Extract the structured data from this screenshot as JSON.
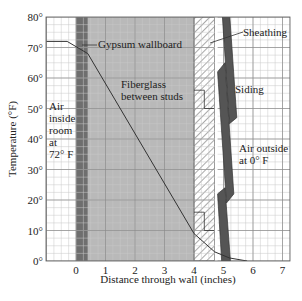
{
  "chart_data": {
    "type": "line",
    "title": "",
    "xlabel": "Distance through wall (inches)",
    "ylabel": "Temperature (°F)",
    "xlim": [
      -1,
      7.5
    ],
    "ylim": [
      0,
      80
    ],
    "x_ticks": [
      "0",
      "1",
      "2",
      "3",
      "4",
      "5",
      "6",
      "7"
    ],
    "y_ticks": [
      "0°",
      "10°",
      "20°",
      "30°",
      "40°",
      "50°",
      "60°",
      "70°",
      "80°"
    ],
    "grid": true,
    "series": [
      {
        "name": "Temperature profile",
        "x": [
          -1.0,
          -0.3,
          0.4,
          4.0,
          4.7,
          5.2,
          5.8
        ],
        "y": [
          72,
          72,
          68,
          9,
          3,
          1,
          0
        ]
      }
    ],
    "regions": [
      {
        "name": "Gypsum wallboard",
        "x_start": 0.0,
        "x_end": 0.4
      },
      {
        "name": "Fiberglass between studs",
        "x_start": 0.4,
        "x_end": 4.0
      },
      {
        "name": "Sheathing",
        "x_start": 4.0,
        "x_end": 4.7
      },
      {
        "name": "Siding",
        "x_start": 4.8,
        "x_end": 5.4
      }
    ]
  },
  "labels": {
    "gypsum": "Gypsum wallboard",
    "sheathing": "Sheathing",
    "fiberglass_1": "Fiberglass",
    "fiberglass_2": "between studs",
    "siding": "Siding",
    "air_inside": [
      "Air",
      "inside",
      "room",
      "at",
      "72° F"
    ],
    "air_outside": [
      "Air outside",
      "at 0° F"
    ]
  },
  "colors": {
    "grid_minor": "#c8c8c8",
    "grid_major": "#8a8a8a",
    "fiberglass_fill": "#b9b9b9",
    "gypsum_fill": "#6e6e6e",
    "siding_fill": "#555555",
    "line": "#333333"
  }
}
